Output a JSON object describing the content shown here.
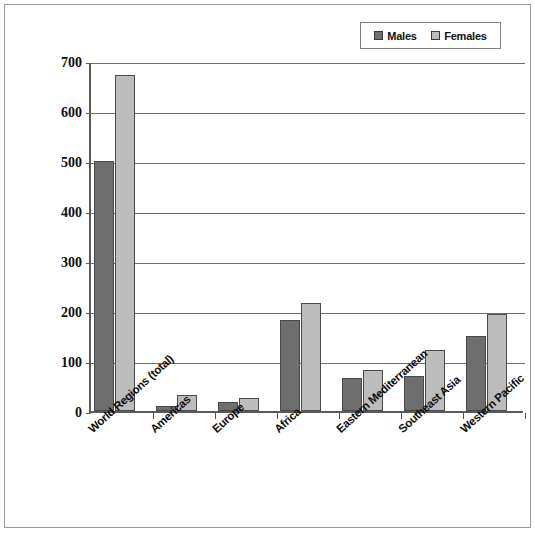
{
  "chart_data": {
    "type": "bar",
    "title": "",
    "subtitle": "",
    "xlabel": "",
    "ylabel": "",
    "ylim": [
      0,
      700
    ],
    "yticks": [
      0,
      100,
      200,
      300,
      400,
      500,
      600,
      700
    ],
    "ytick_labels": [
      "0",
      "100",
      "200",
      "300",
      "400",
      "500",
      "600",
      "700"
    ],
    "grid": true,
    "legend_position": "top-right",
    "categories": [
      "World Regions (total)",
      "Americas",
      "Europe",
      "Africa",
      "Eastern Mediterranean",
      "Southeast Asia",
      "Western Pacific"
    ],
    "series": [
      {
        "name": "Males",
        "color": "#6e6e6e",
        "values": [
          500,
          10,
          19,
          183,
          66,
          70,
          151
        ]
      },
      {
        "name": "Females",
        "color": "#bcbcbc",
        "values": [
          672,
          32,
          27,
          216,
          82,
          122,
          194
        ]
      }
    ]
  },
  "legend": {
    "entries": [
      {
        "label": "Males",
        "swatch_color": "#6e6e6e"
      },
      {
        "label": "Females",
        "swatch_color": "#bcbcbc"
      }
    ]
  },
  "colors": {
    "males": "#6e6e6e",
    "females": "#bcbcbc",
    "axis": "#5a5a5a",
    "gridline": "#6f6f6f",
    "frame": "#9a9a9a",
    "text": "#0d0d0d"
  }
}
